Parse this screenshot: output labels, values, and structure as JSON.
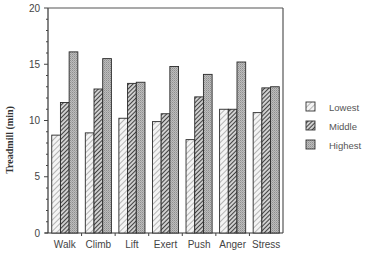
{
  "chart_data": {
    "type": "bar",
    "title": "",
    "xlabel": "",
    "ylabel": "Treadmill (min)",
    "ylim": [
      0,
      20
    ],
    "yticks": [
      0,
      5,
      10,
      15,
      20
    ],
    "grid": false,
    "legend_position": "right",
    "categories": [
      "Walk",
      "Climb",
      "Lift",
      "Exert",
      "Push",
      "Anger",
      "Stress"
    ],
    "series": [
      {
        "name": "Lowest",
        "pattern": "light-hatch",
        "values": [
          8.7,
          8.9,
          10.2,
          9.9,
          8.3,
          11.0,
          10.7
        ]
      },
      {
        "name": "Middle",
        "pattern": "dark-hatch",
        "values": [
          11.6,
          12.8,
          13.3,
          10.6,
          12.1,
          11.0,
          12.9
        ]
      },
      {
        "name": "Highest",
        "pattern": "gray-dots",
        "values": [
          16.1,
          15.5,
          13.4,
          14.8,
          14.1,
          15.2,
          13.0
        ]
      }
    ]
  },
  "legend": {
    "items": [
      {
        "label": "Lowest"
      },
      {
        "label": "Middle"
      },
      {
        "label": "Highest"
      }
    ]
  },
  "axis": {
    "ylabel": "Treadmill (min)"
  }
}
